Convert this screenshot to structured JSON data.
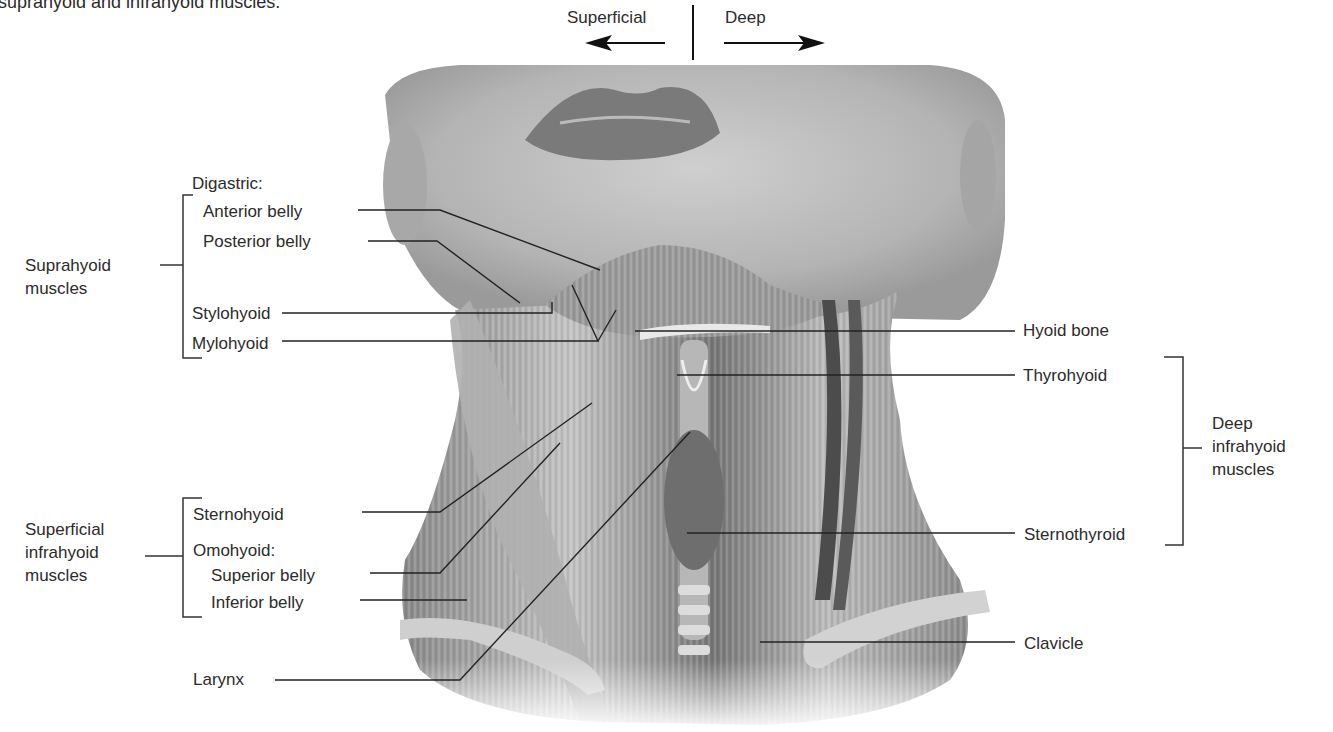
{
  "caption": "suprahyoid and infrahyoid muscles.",
  "orientation": {
    "left_label": "Superficial",
    "right_label": "Deep"
  },
  "groups": {
    "suprahyoid": [
      "Suprahyoid",
      "muscles"
    ],
    "superficial_infrahyoid": [
      "Superficial",
      "infrahyoid",
      "muscles"
    ],
    "deep_infrahyoid": [
      "Deep",
      "infrahyoid",
      "muscles"
    ]
  },
  "left_labels": {
    "digastric": "Digastric:",
    "anterior_belly": "Anterior belly",
    "posterior_belly": "Posterior belly",
    "stylohyoid": "Stylohyoid",
    "mylohyoid": "Mylohyoid",
    "sternohyoid": "Sternohyoid",
    "omohyoid": "Omohyoid:",
    "superior_belly": "Superior belly",
    "inferior_belly": "Inferior belly",
    "larynx": "Larynx"
  },
  "right_labels": {
    "hyoid_bone": "Hyoid bone",
    "thyrohyoid": "Thyrohyoid",
    "sternothyroid": "Sternothyroid",
    "clavicle": "Clavicle"
  },
  "colors": {
    "text": "#2b2b2b",
    "leader_line": "#222222",
    "background": "#ffffff"
  }
}
